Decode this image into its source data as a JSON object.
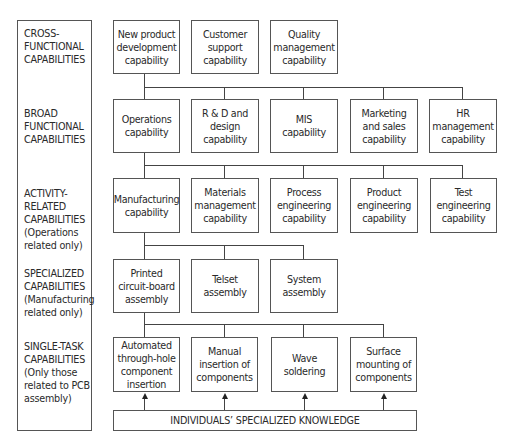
{
  "levels": [
    {
      "label": "CROSS-\nFUNCTIONAL\nCAPABILITIES"
    },
    {
      "label": "BROAD\nFUNCTIONAL\nCAPABILITIES"
    },
    {
      "label": "ACTIVITY-\nRELATED\nCAPABILITIES\n(Operations\nrelated only)"
    },
    {
      "label": "SPECIALIZED\nCAPABILITIES\n(Manufacturing\nrelated only)"
    },
    {
      "label": "SINGLE-TASK\nCAPABILITIES\n(Only those\nrelated to PCB\nassembly)"
    }
  ],
  "rows": {
    "cross_functional": [
      "New product\ndevelopment\ncapability",
      "Customer\nsupport\ncapability",
      "Quality\nmanagement\ncapability"
    ],
    "broad_functional": [
      "Operations\ncapability",
      "R & D and\ndesign\ncapability",
      "MIS\ncapability",
      "Marketing\nand sales\ncapability",
      "HR\nmanagement\ncapability"
    ],
    "activity_related": [
      "Manufacturing\ncapability",
      "Materials\nmanagement\ncapability",
      "Process\nengineering\ncapability",
      "Product\nengineering\ncapability",
      "Test\nengineering\ncapability"
    ],
    "specialized": [
      "Printed\ncircuit-board\nassembly",
      "Telset\nassembly",
      "System\nassembly"
    ],
    "single_task": [
      "Automated\nthrough-hole\ncomponent\ninsertion",
      "Manual\ninsertion of\ncomponents",
      "Wave\nsoldering",
      "Surface\nmounting of\ncomponents"
    ]
  },
  "foundation": "INDIVIDUALS’ SPECIALIZED KNOWLEDGE"
}
